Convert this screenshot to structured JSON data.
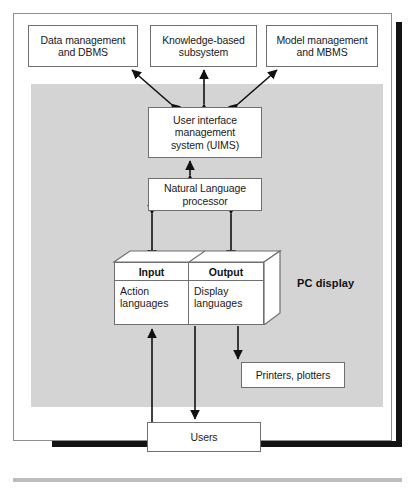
{
  "diagram": {
    "colors": {
      "shaded_region": "#d4d4d4",
      "box_border": "#6f6f6f",
      "frame_border": "#8d8d8d",
      "shadow": "#141414",
      "text": "#1a1a1a"
    },
    "nodes": {
      "data_management": "Data management\nand DBMS",
      "knowledge_based": "Knowledge-based\nsubsystem",
      "model_management": "Model management\nand MBMS",
      "uims": "User interface\nmanagement\nsystem (UIMS)",
      "nlp": "Natural Language\nprocessor",
      "printers": "Printers, plotters",
      "users": "Users"
    },
    "pc_display": {
      "label": "PC display",
      "input_header": "Input",
      "output_header": "Output",
      "input_body": "Action\nlanguages",
      "output_body": "Display\nlanguages"
    },
    "edges": [
      {
        "from": "uims",
        "to": "data_management",
        "style": "double-arrow-diagonal"
      },
      {
        "from": "uims",
        "to": "knowledge_based",
        "style": "double-arrow-vertical"
      },
      {
        "from": "uims",
        "to": "model_management",
        "style": "double-arrow-diagonal"
      },
      {
        "from": "uims",
        "to": "nlp",
        "style": "double-arrow-vertical"
      },
      {
        "from": "nlp",
        "to": "input",
        "style": "double-arrow-vertical"
      },
      {
        "from": "nlp",
        "to": "output",
        "style": "double-arrow-vertical"
      },
      {
        "from": "users",
        "to": "input",
        "style": "arrow-up"
      },
      {
        "from": "output",
        "to": "users",
        "style": "arrow-down"
      },
      {
        "from": "output",
        "to": "printers",
        "style": "arrow-down"
      }
    ]
  }
}
